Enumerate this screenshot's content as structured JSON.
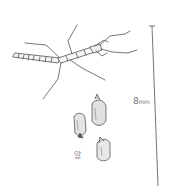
{
  "figure": {
    "scale_bar": {
      "value": "8",
      "unit": "mm"
    },
    "egg_label": "알",
    "colors": {
      "ink": "#555555",
      "scale_bar": "#666666",
      "background": "#ffffff"
    }
  }
}
